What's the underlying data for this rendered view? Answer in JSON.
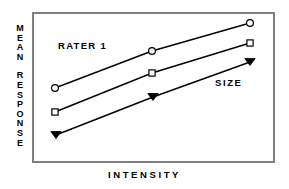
{
  "figure": {
    "background_color": "#ffffff",
    "frame_color": "#7f7f7f",
    "ink_color": "#000000"
  },
  "axis_titles": {
    "y_line1": "MEAN",
    "y_line2": "RESPONSE",
    "x": "INTENSITY"
  },
  "annotations": {
    "rater": "RATER 1",
    "size": "SIZE"
  },
  "chart_data": {
    "type": "line",
    "title": "",
    "subtitle": "",
    "xlabel": "INTENSITY",
    "ylabel": "MEAN RESPONSE",
    "xlim": [
      0,
      3
    ],
    "ylim": [
      0,
      3
    ],
    "grid": false,
    "axis_ticks": false,
    "tick_labels_x": [],
    "tick_labels_y": [],
    "legend": false,
    "legend_position": "none",
    "annotations": [
      {
        "text": "RATER 1",
        "x": 0.28,
        "y": 2.62,
        "bold": true
      },
      {
        "text": "SIZE",
        "x": 2.42,
        "y": 1.86,
        "bold": true
      }
    ],
    "x": [
      1,
      2,
      3
    ],
    "series": [
      {
        "name": "large",
        "marker": "circle-open",
        "values": [
          1.48,
          2.18,
          2.7
        ],
        "points_px": [
          [
            55,
            88
          ],
          [
            152,
            51
          ],
          [
            250,
            23
          ]
        ]
      },
      {
        "name": "medium",
        "marker": "square-open",
        "values": [
          1.04,
          1.79,
          2.32
        ],
        "points_px": [
          [
            55,
            112
          ],
          [
            152,
            73
          ],
          [
            250,
            43
          ]
        ]
      },
      {
        "name": "small",
        "marker": "triangle-down-filled",
        "values": [
          0.6,
          1.34,
          1.97
        ],
        "points_px": [
          [
            56,
            135
          ],
          [
            153,
            97
          ],
          [
            250,
            62
          ]
        ]
      }
    ]
  }
}
